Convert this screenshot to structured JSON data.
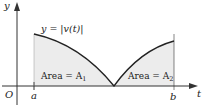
{
  "figure": {
    "curve_label": "y = |v(t)|",
    "y_axis_label": "y",
    "x_axis_label": "t",
    "origin_label": "O",
    "tick_a": "a",
    "tick_b": "b",
    "area1_text": "Area = A",
    "area1_sub": "1",
    "area2_text": "Area = A",
    "area2_sub": "2"
  },
  "colors": {
    "curve": "#222222",
    "fill": "#ececec",
    "axis": "#333333"
  }
}
